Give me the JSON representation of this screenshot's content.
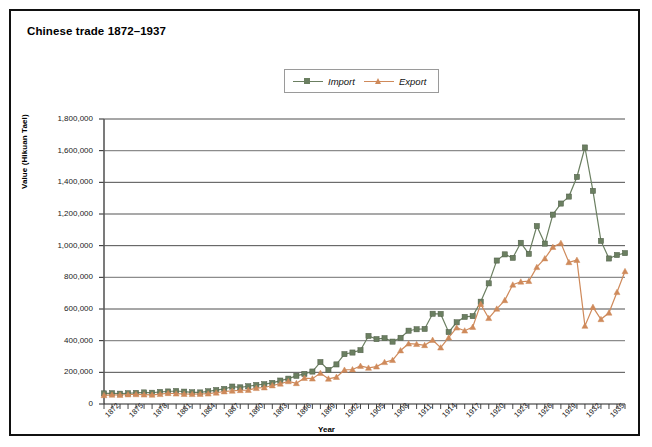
{
  "figure": {
    "title": "Chinese trade 1872–1937",
    "border_color": "#111111",
    "background": "#ffffff"
  },
  "legend": {
    "position": "top-center",
    "entries": [
      {
        "label": "Import",
        "color": "#6b7f61",
        "marker": "square"
      },
      {
        "label": "Export",
        "color": "#cf8a5b",
        "marker": "triangle"
      }
    ]
  },
  "axes": {
    "x_title": "Year",
    "y_title": "Value (Hikuan Tael)",
    "y_ticks": [
      "0",
      "200,000",
      "400,000",
      "600,000",
      "800,000",
      "1,000,000",
      "1,200,000",
      "1,400,000",
      "1,600,000",
      "1,800,000"
    ],
    "x_ticks": [
      "1872",
      "1875",
      "1878",
      "1881",
      "1884",
      "1887",
      "1890",
      "1893",
      "1896",
      "1899",
      "1902",
      "1905",
      "1908",
      "1911",
      "1914",
      "1917",
      "1920",
      "1923",
      "1926",
      "1929",
      "1932",
      "1935"
    ]
  },
  "chart_data": {
    "type": "line",
    "title": "Chinese trade 1872–1937",
    "xlabel": "Year",
    "ylabel": "Value (Hikuan Tael)",
    "ylim": [
      0,
      1800000
    ],
    "ytick_step": 200000,
    "xlim": [
      1872,
      1937
    ],
    "grid": true,
    "grid_axis": "y",
    "legend_position": "top-center",
    "x": [
      1872,
      1873,
      1874,
      1875,
      1876,
      1877,
      1878,
      1879,
      1880,
      1881,
      1882,
      1883,
      1884,
      1885,
      1886,
      1887,
      1888,
      1889,
      1890,
      1891,
      1892,
      1893,
      1894,
      1895,
      1896,
      1897,
      1898,
      1899,
      1900,
      1901,
      1902,
      1903,
      1904,
      1905,
      1906,
      1907,
      1908,
      1909,
      1910,
      1911,
      1912,
      1913,
      1914,
      1915,
      1916,
      1917,
      1918,
      1919,
      1920,
      1921,
      1922,
      1923,
      1924,
      1925,
      1926,
      1927,
      1928,
      1929,
      1930,
      1931,
      1932,
      1933,
      1934,
      1935,
      1936,
      1937
    ],
    "series": [
      {
        "name": "Import",
        "color": "#6b7f61",
        "marker": "square",
        "values": [
          67000,
          68000,
          65000,
          68000,
          70000,
          73000,
          71000,
          76000,
          79000,
          82000,
          78000,
          74000,
          73000,
          80000,
          88000,
          95000,
          110000,
          105000,
          112000,
          120000,
          125000,
          133000,
          148000,
          160000,
          178000,
          190000,
          205000,
          265000,
          215000,
          250000,
          315000,
          325000,
          340000,
          430000,
          410000,
          416000,
          394000,
          418000,
          463000,
          472000,
          474000,
          570000,
          569000,
          454000,
          516000,
          550000,
          555000,
          646000,
          762000,
          906000,
          945000,
          923000,
          1018000,
          948000,
          1124000,
          1013000,
          1196000,
          1266000,
          1310000,
          1434000,
          1620000,
          1346000,
          1030000,
          919000,
          941000,
          953000
        ]
      },
      {
        "name": "Export",
        "color": "#cf8a5b",
        "marker": "triangle",
        "values": [
          55000,
          58000,
          57000,
          60000,
          61000,
          59000,
          58000,
          62000,
          68000,
          65000,
          63000,
          62000,
          63000,
          65000,
          71000,
          79000,
          83000,
          87000,
          88000,
          100000,
          104000,
          117000,
          128000,
          143000,
          131000,
          164000,
          160000,
          195000,
          159000,
          170000,
          215000,
          218000,
          240000,
          228000,
          236000,
          264000,
          277000,
          338000,
          381000,
          378000,
          371000,
          404000,
          356000,
          419000,
          482000,
          463000,
          486000,
          631000,
          542000,
          601000,
          655000,
          753000,
          772000,
          776000,
          864000,
          919000,
          991000,
          1016000,
          895000,
          909000,
          493000,
          612000,
          535000,
          576000,
          706000,
          838000
        ]
      }
    ]
  }
}
